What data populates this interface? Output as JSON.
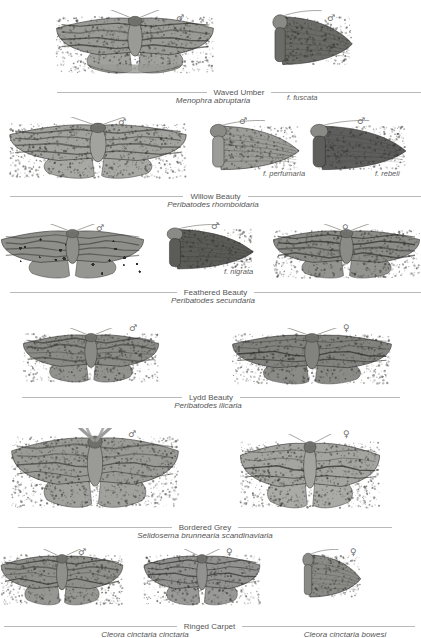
{
  "plate": {
    "title": "Geometridae plate - Ennominae",
    "background": "#ffffff",
    "rule_color": "#b9b9b9",
    "text_color": "#555555"
  },
  "symbols": {
    "male": "♂",
    "female": "♀"
  },
  "species": [
    {
      "id": "waved-umber",
      "common_name": "Waved Umber",
      "scientific_name": "Menophra abruptaria",
      "rule_left": 57,
      "rule_right": 421,
      "rule_y": 86,
      "sci_x": 213,
      "sci_y": 96,
      "specimens": [
        {
          "id": "waved-umber-male",
          "sex": "male",
          "sex_x": 176,
          "sex_y": 14,
          "form": null,
          "form_x": 0,
          "form_y": 0,
          "x": 55,
          "y": 10,
          "w": 160,
          "h": 70,
          "shape": "spread-broad",
          "tone": "#9a9a96"
        },
        {
          "id": "waved-umber-f-fuscata",
          "sex": "male",
          "sex_x": 327,
          "sex_y": 14,
          "form": "f. fuscata",
          "form_x": 287,
          "form_y": 93,
          "x": 269,
          "y": 10,
          "w": 85,
          "h": 68,
          "shape": "folded-dark",
          "tone": "#6b6b68"
        }
      ]
    },
    {
      "id": "willow-beauty",
      "common_name": "Willow Beauty",
      "scientific_name": "Peribatodes rhomboidaria",
      "rule_left": 10,
      "rule_right": 421,
      "rule_y": 190,
      "sci_x": 213,
      "sci_y": 200,
      "specimens": [
        {
          "id": "willow-beauty-male",
          "sex": "male",
          "sex_x": 118,
          "sex_y": 118,
          "form": null,
          "form_x": 0,
          "form_y": 0,
          "x": 8,
          "y": 117,
          "w": 180,
          "h": 68,
          "shape": "spread-wide",
          "tone": "#a2a29e"
        },
        {
          "id": "willow-beauty-f-perfumaria",
          "sex": "male",
          "sex_x": 239,
          "sex_y": 117,
          "form": "f. perfumaria",
          "form_x": 263,
          "form_y": 169,
          "x": 206,
          "y": 120,
          "w": 95,
          "h": 62,
          "shape": "folded-pale",
          "tone": "#9c9c98"
        },
        {
          "id": "willow-beauty-f-rebeli",
          "sex": "male",
          "sex_x": 357,
          "sex_y": 117,
          "form": "f. rebeli",
          "form_x": 375,
          "form_y": 169,
          "x": 306,
          "y": 120,
          "w": 102,
          "h": 62,
          "shape": "folded-dark",
          "tone": "#5e5e5c"
        }
      ]
    },
    {
      "id": "feathered-beauty",
      "common_name": "Feathered Beauty",
      "scientific_name": "Peribatodes secundaria",
      "rule_left": 10,
      "rule_right": 421,
      "rule_y": 286,
      "sci_x": 213,
      "sci_y": 296,
      "specimens": [
        {
          "id": "feathered-beauty-male",
          "sex": "male",
          "sex_x": 96,
          "sex_y": 224,
          "form": null,
          "form_x": 0,
          "form_y": 0,
          "x": 0,
          "y": 224,
          "w": 145,
          "h": 60,
          "shape": "spread-wide",
          "tone": "#8e8e8a"
        },
        {
          "id": "feathered-beauty-f-nigrata",
          "sex": "male",
          "sex_x": 211,
          "sex_y": 222,
          "form": "f. nigrata",
          "form_x": 224,
          "form_y": 267,
          "x": 163,
          "y": 224,
          "w": 92,
          "h": 56,
          "shape": "folded-dark",
          "tone": "#5b5b58"
        },
        {
          "id": "feathered-beauty-female",
          "sex": "female",
          "sex_x": 342,
          "sex_y": 224,
          "form": null,
          "form_x": 0,
          "form_y": 0,
          "x": 272,
          "y": 224,
          "w": 149,
          "h": 60,
          "shape": "spread-wide",
          "tone": "#8b8b87"
        }
      ]
    },
    {
      "id": "lydd-beauty",
      "common_name": "Lydd Beauty",
      "scientific_name": "Peribatodes ilicaria",
      "rule_left": 22,
      "rule_right": 400,
      "rule_y": 391,
      "sci_x": 208,
      "sci_y": 401,
      "specimens": [
        {
          "id": "lydd-beauty-male",
          "sex": "male",
          "sex_x": 129,
          "sex_y": 324,
          "form": null,
          "form_x": 0,
          "form_y": 0,
          "x": 22,
          "y": 328,
          "w": 138,
          "h": 60,
          "shape": "spread-wide",
          "tone": "#8a8a86"
        },
        {
          "id": "lydd-beauty-female",
          "sex": "female",
          "sex_x": 343,
          "sex_y": 324,
          "form": null,
          "form_x": 0,
          "form_y": 0,
          "x": 231,
          "y": 328,
          "w": 162,
          "h": 62,
          "shape": "spread-wide",
          "tone": "#82827e"
        }
      ]
    },
    {
      "id": "bordered-grey",
      "common_name": "Bordered Grey",
      "scientific_name": "Selidosema brunnearia scandinaviaria",
      "rule_left": 18,
      "rule_right": 392,
      "rule_y": 521,
      "sci_x": 205,
      "sci_y": 531,
      "specimens": [
        {
          "id": "bordered-grey-male",
          "sex": "male",
          "sex_x": 128,
          "sex_y": 430,
          "form": null,
          "form_x": 0,
          "form_y": 0,
          "x": 10,
          "y": 428,
          "w": 170,
          "h": 88,
          "shape": "spread-feathered",
          "tone": "#9a9a96"
        },
        {
          "id": "bordered-grey-female",
          "sex": "female",
          "sex_x": 343,
          "sex_y": 430,
          "form": null,
          "form_x": 0,
          "form_y": 0,
          "x": 239,
          "y": 434,
          "w": 142,
          "h": 82,
          "shape": "spread-plain",
          "tone": "#a4a4a0"
        }
      ]
    },
    {
      "id": "ringed-carpet",
      "common_name": "Ringed Carpet",
      "scientific_name": "Cleora cinctaria cinctaria",
      "rule_left": 4,
      "rule_right": 415,
      "rule_y": 620,
      "sci_x": 145,
      "sci_y": 630,
      "second_scientific_name": "Cleora cinctaria bowesi",
      "sci2_x": 345,
      "sci2_y": 630,
      "specimens": [
        {
          "id": "ringed-carpet-male",
          "sex": "male",
          "sex_x": 78,
          "sex_y": 548,
          "form": null,
          "form_x": 0,
          "form_y": 0,
          "x": 0,
          "y": 549,
          "w": 124,
          "h": 62,
          "shape": "spread-wide",
          "tone": "#8f8f8b"
        },
        {
          "id": "ringed-carpet-female",
          "sex": "female",
          "sex_x": 226,
          "sex_y": 548,
          "form": null,
          "form_x": 0,
          "form_y": 0,
          "x": 143,
          "y": 549,
          "w": 118,
          "h": 62,
          "shape": "spread-wide",
          "tone": "#929290"
        },
        {
          "id": "ringed-carpet-bowesi-female",
          "sex": "female",
          "sex_x": 350,
          "sex_y": 548,
          "form": null,
          "form_x": 0,
          "form_y": 0,
          "x": 300,
          "y": 549,
          "w": 62,
          "h": 60,
          "shape": "folded-pale",
          "tone": "#8a8a86"
        }
      ]
    }
  ]
}
